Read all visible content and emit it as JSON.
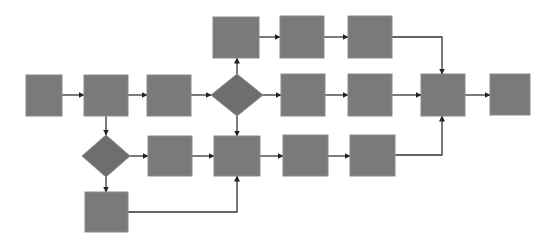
{
  "diagram": {
    "type": "flowchart",
    "background": "#ffffff",
    "colors": {
      "process_fill": "#7a7a7a",
      "process_stroke": "#8a8a8a",
      "decision_fill": "#6e6e6e",
      "connector": "#333333"
    },
    "nodes": [
      {
        "id": "n1",
        "shape": "rect",
        "x": 26,
        "y": 75,
        "w": 36,
        "h": 41
      },
      {
        "id": "n2",
        "shape": "rect",
        "x": 84,
        "y": 75,
        "w": 44,
        "h": 41
      },
      {
        "id": "n3",
        "shape": "rect",
        "x": 147,
        "y": 75,
        "w": 44,
        "h": 41
      },
      {
        "id": "d1",
        "shape": "diamond",
        "cx": 237,
        "cy": 95,
        "rx": 26,
        "ry": 21
      },
      {
        "id": "t1",
        "shape": "rect",
        "x": 213,
        "y": 17,
        "w": 46,
        "h": 41
      },
      {
        "id": "t2",
        "shape": "rect",
        "x": 280,
        "y": 16,
        "w": 44,
        "h": 42
      },
      {
        "id": "t3",
        "shape": "rect",
        "x": 348,
        "y": 16,
        "w": 44,
        "h": 42
      },
      {
        "id": "m1",
        "shape": "rect",
        "x": 281,
        "y": 74,
        "w": 44,
        "h": 42
      },
      {
        "id": "m2",
        "shape": "rect",
        "x": 348,
        "y": 74,
        "w": 44,
        "h": 42
      },
      {
        "id": "merge",
        "shape": "rect",
        "x": 421,
        "y": 74,
        "w": 44,
        "h": 42
      },
      {
        "id": "final",
        "shape": "rect",
        "x": 490,
        "y": 74,
        "w": 40,
        "h": 41
      },
      {
        "id": "d2",
        "shape": "diamond",
        "cx": 106,
        "cy": 156,
        "rx": 24,
        "ry": 21
      },
      {
        "id": "b1",
        "shape": "rect",
        "x": 148,
        "y": 136,
        "w": 44,
        "h": 40
      },
      {
        "id": "b2",
        "shape": "rect",
        "x": 214,
        "y": 136,
        "w": 46,
        "h": 40
      },
      {
        "id": "b3",
        "shape": "rect",
        "x": 283,
        "y": 135,
        "w": 45,
        "h": 41
      },
      {
        "id": "b4",
        "shape": "rect",
        "x": 350,
        "y": 135,
        "w": 45,
        "h": 41
      },
      {
        "id": "k1",
        "shape": "rect",
        "x": 85,
        "y": 192,
        "w": 43,
        "h": 40
      }
    ],
    "edges": [
      {
        "from": "n1",
        "to": "n2",
        "points": [
          [
            62,
            95
          ],
          [
            84,
            95
          ]
        ]
      },
      {
        "from": "n2",
        "to": "n3",
        "points": [
          [
            128,
            95
          ],
          [
            147,
            95
          ]
        ]
      },
      {
        "from": "n3",
        "to": "d1",
        "points": [
          [
            191,
            95
          ],
          [
            211,
            95
          ]
        ]
      },
      {
        "from": "d1",
        "to": "t1",
        "points": [
          [
            237,
            74
          ],
          [
            237,
            58
          ]
        ]
      },
      {
        "from": "t1",
        "to": "t2",
        "points": [
          [
            259,
            37
          ],
          [
            280,
            37
          ]
        ]
      },
      {
        "from": "t2",
        "to": "t3",
        "points": [
          [
            324,
            37
          ],
          [
            348,
            37
          ]
        ]
      },
      {
        "from": "t3",
        "to": "merge",
        "points": [
          [
            392,
            37
          ],
          [
            442,
            37
          ],
          [
            442,
            74
          ]
        ]
      },
      {
        "from": "d1",
        "to": "m1",
        "points": [
          [
            263,
            95
          ],
          [
            281,
            95
          ]
        ]
      },
      {
        "from": "m1",
        "to": "m2",
        "points": [
          [
            325,
            95
          ],
          [
            348,
            95
          ]
        ]
      },
      {
        "from": "m2",
        "to": "merge",
        "points": [
          [
            392,
            95
          ],
          [
            421,
            95
          ]
        ]
      },
      {
        "from": "merge",
        "to": "final",
        "points": [
          [
            465,
            95
          ],
          [
            490,
            95
          ]
        ]
      },
      {
        "from": "d1",
        "to": "b2",
        "points": [
          [
            237,
            116
          ],
          [
            237,
            136
          ]
        ]
      },
      {
        "from": "n2",
        "to": "d2",
        "points": [
          [
            106,
            116
          ],
          [
            106,
            135
          ]
        ]
      },
      {
        "from": "d2",
        "to": "b1",
        "points": [
          [
            130,
            156
          ],
          [
            148,
            156
          ]
        ]
      },
      {
        "from": "b1",
        "to": "b2",
        "points": [
          [
            192,
            156
          ],
          [
            214,
            156
          ]
        ]
      },
      {
        "from": "b2",
        "to": "b3",
        "points": [
          [
            260,
            156
          ],
          [
            283,
            156
          ]
        ]
      },
      {
        "from": "b3",
        "to": "b4",
        "points": [
          [
            328,
            156
          ],
          [
            350,
            156
          ]
        ]
      },
      {
        "from": "b4",
        "to": "merge",
        "points": [
          [
            395,
            155
          ],
          [
            442,
            155
          ],
          [
            442,
            116
          ]
        ]
      },
      {
        "from": "d2",
        "to": "k1",
        "points": [
          [
            106,
            177
          ],
          [
            106,
            192
          ]
        ]
      },
      {
        "from": "k1",
        "to": "b2",
        "points": [
          [
            128,
            212
          ],
          [
            237,
            212
          ],
          [
            237,
            176
          ]
        ]
      }
    ]
  }
}
